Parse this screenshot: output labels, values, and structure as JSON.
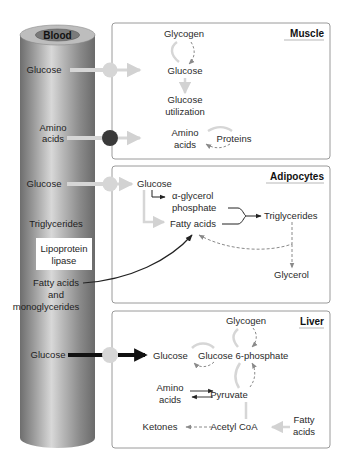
{
  "blood": {
    "title": "Blood",
    "labels": {
      "glucose_1": "Glucose",
      "amino_1": "Amino",
      "amino_2": "acids",
      "glucose_2": "Glucose",
      "triglycerides": "Triglycerides",
      "lipase_1": "Lipoprotein",
      "lipase_2": "lipase",
      "fatty_1": "Fatty acids",
      "fatty_2": "and",
      "fatty_3": "monoglycerides",
      "glucose_3": "Glucose"
    }
  },
  "muscle": {
    "title": "Muscle",
    "glycogen": "Glycogen",
    "glucose": "Glucose",
    "util_1": "Glucose",
    "util_2": "utilization",
    "amino_1": "Amino",
    "amino_2": "acids",
    "proteins": "Proteins"
  },
  "adipocytes": {
    "title": "Adipocytes",
    "glucose": "Glucose",
    "agp_1": "α-glycerol",
    "agp_2": "phosphate",
    "fatty": "Fatty acids",
    "triglycerides": "Triglycerides",
    "glycerol": "Glycerol"
  },
  "liver": {
    "title": "Liver",
    "glycogen": "Glycogen",
    "glucose": "Glucose",
    "g6p": "Glucose 6-phosphate",
    "amino_1": "Amino",
    "amino_2": "acids",
    "pyruvate": "Pyruvate",
    "ketones": "Ketones",
    "acetyl": "Acetyl CoA",
    "fatty_1": "Fatty",
    "fatty_2": "acids"
  },
  "colors": {
    "box_border": "#9a9a9a",
    "light_arrow": "#d2d2d2",
    "dark_node": "#3a3a3a",
    "dashed": "#8a8a8a",
    "black_arrow": "#111111"
  }
}
